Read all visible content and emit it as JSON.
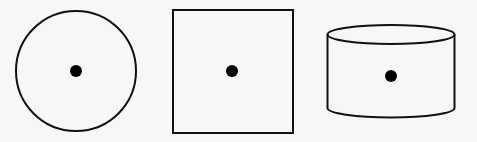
{
  "diagram": {
    "background": "#f7f7f7",
    "stroke_color": "#111111",
    "dot_color": "#000000",
    "shapes": [
      {
        "name": "circle",
        "cx": 76,
        "cy": 71,
        "r": 60,
        "dot": {
          "cx": 76,
          "cy": 71,
          "r": 6
        }
      },
      {
        "name": "square",
        "x": 173,
        "y": 10,
        "width": 120,
        "height": 123,
        "dot": {
          "cx": 232,
          "cy": 71,
          "r": 6
        }
      },
      {
        "name": "cylinder",
        "cx": 391,
        "top_cy": 34.5,
        "rx": 63.5,
        "ry": 9.5,
        "side_bottom_y": 108,
        "bottom_cy": 108,
        "dot": {
          "cx": 391,
          "cy": 76,
          "r": 6
        }
      }
    ]
  }
}
